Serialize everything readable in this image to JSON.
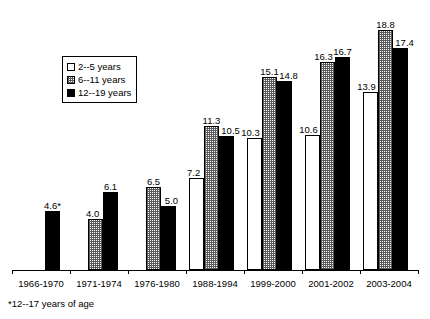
{
  "chart_data": {
    "type": "bar",
    "title": "",
    "subtitle": "",
    "xlabel": "",
    "ylabel": "",
    "ylim": [
      0,
      20.5
    ],
    "grid": false,
    "legend_position": "upper-left",
    "categories": [
      "1966-1970",
      "1971-1974",
      "1976-1980",
      "1988-1994",
      "1999-2000",
      "2001-2002",
      "2003-2004"
    ],
    "series": [
      {
        "name": "2--5 years",
        "fill": "white",
        "values": [
          null,
          null,
          null,
          7.2,
          10.3,
          10.6,
          13.9
        ],
        "labels": [
          "",
          "",
          "",
          "7.2",
          "10.3",
          "10.6",
          "13.9"
        ]
      },
      {
        "name": "6--11 years",
        "fill": "gray",
        "values": [
          null,
          4.0,
          6.5,
          11.3,
          15.1,
          16.3,
          18.8
        ],
        "labels": [
          "",
          "4.0",
          "6.5",
          "11.3",
          "15.1",
          "16.3",
          "18.8"
        ]
      },
      {
        "name": "12--19 years",
        "fill": "black",
        "values": [
          4.6,
          6.1,
          5.0,
          10.5,
          14.8,
          16.7,
          17.4
        ],
        "labels": [
          "4.6*",
          "6.1",
          "5.0",
          "10.5",
          "14.8",
          "16.7",
          "17.4"
        ]
      }
    ],
    "annotations": [
      "*12--17 years of age"
    ]
  },
  "legend": {
    "items": [
      {
        "label": "2--5 years",
        "swatch": "white"
      },
      {
        "label": "6--11 years",
        "swatch": "gray"
      },
      {
        "label": "12--19 years",
        "swatch": "black"
      }
    ]
  },
  "axis": {
    "categories": [
      "1966-1970",
      "1971-1974",
      "1976-1980",
      "1988-1994",
      "1999-2000",
      "2001-2002",
      "2003-2004"
    ]
  },
  "footnote": {
    "text": "*12--17 years of age"
  },
  "colors": {
    "axis": "#000000",
    "bar_outline": "#000000",
    "bar_white": "#ffffff",
    "bar_gray": "#c8c8c8",
    "bar_black": "#000000",
    "text": "#000000",
    "background": "#ffffff"
  }
}
